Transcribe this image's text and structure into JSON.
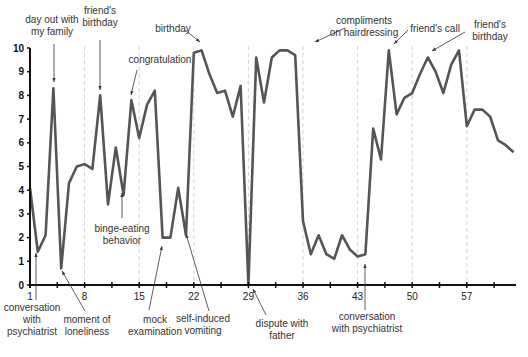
{
  "chart_data": {
    "type": "line",
    "title": "",
    "xlabel": "",
    "ylabel": "",
    "xlim": [
      1,
      63
    ],
    "ylim": [
      0,
      10
    ],
    "grid": "dashed vertical lines every 7 days",
    "x_ticks": [
      1,
      8,
      15,
      22,
      29,
      36,
      43,
      50,
      57
    ],
    "y_ticks": [
      0,
      1,
      2,
      3,
      4,
      5,
      6,
      7,
      8,
      9,
      10
    ],
    "x": [
      1,
      2,
      3,
      4,
      5,
      6,
      7,
      8,
      9,
      10,
      11,
      12,
      13,
      14,
      15,
      16,
      17,
      18,
      19,
      20,
      21,
      22,
      23,
      24,
      25,
      26,
      27,
      28,
      29,
      30,
      31,
      32,
      33,
      34,
      35,
      36,
      37,
      38,
      39,
      40,
      41,
      42,
      43,
      44,
      45,
      46,
      47,
      48,
      49,
      50,
      51,
      52,
      53,
      54,
      55,
      56,
      57,
      58,
      59,
      60,
      61,
      62,
      63
    ],
    "series": [
      {
        "name": "mood",
        "color": "#555555",
        "values": [
          4.1,
          1.4,
          2.1,
          8.3,
          0.7,
          4.3,
          5.0,
          5.1,
          4.9,
          8.0,
          3.4,
          5.8,
          3.8,
          7.8,
          6.2,
          7.6,
          8.2,
          2.0,
          2.0,
          4.1,
          2.1,
          9.8,
          9.9,
          8.9,
          8.1,
          8.2,
          7.1,
          8.4,
          0.0,
          9.6,
          7.7,
          9.6,
          9.9,
          9.9,
          9.7,
          2.7,
          1.3,
          2.1,
          1.3,
          1.1,
          2.1,
          1.5,
          1.2,
          1.3,
          6.6,
          5.3,
          9.9,
          7.2,
          7.9,
          8.1,
          8.9,
          9.6,
          9.0,
          8.1,
          9.3,
          9.9,
          6.7,
          7.4,
          7.4,
          7.1,
          6.1,
          5.9,
          5.6
        ]
      }
    ],
    "annotations": [
      {
        "text": [
          "day out with",
          "my family"
        ],
        "day": 4,
        "position": "above"
      },
      {
        "text": [
          "friend's",
          "birthday"
        ],
        "day": 10,
        "position": "above"
      },
      {
        "text": [
          "congratulation"
        ],
        "day": 14,
        "position": "above"
      },
      {
        "text": [
          "birthday"
        ],
        "day": 22,
        "position": "above"
      },
      {
        "text": [
          "compliments",
          "on hairdressing"
        ],
        "day": 34,
        "position": "above"
      },
      {
        "text": [
          "friend's call"
        ],
        "day": 47,
        "position": "above"
      },
      {
        "text": [
          "friend's",
          "birthday"
        ],
        "day": 52,
        "position": "above"
      },
      {
        "text": [
          "binge-eating",
          "behavior"
        ],
        "day": 13,
        "position": "below-inside"
      },
      {
        "text": [
          "conversation",
          "with",
          "psychiatrist"
        ],
        "day": 2,
        "position": "below"
      },
      {
        "text": [
          "moment of",
          "loneliness"
        ],
        "day": 5,
        "position": "below"
      },
      {
        "text": [
          "mock",
          "examination"
        ],
        "day": 18,
        "position": "below"
      },
      {
        "text": [
          "self-induced",
          "vomiting"
        ],
        "day": 21,
        "position": "below"
      },
      {
        "text": [
          "dispute with",
          "father"
        ],
        "day": 29,
        "position": "below"
      },
      {
        "text": [
          "conversation",
          "with psychiatrist"
        ],
        "day": 44,
        "position": "below"
      }
    ]
  }
}
